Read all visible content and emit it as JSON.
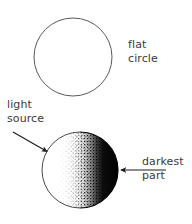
{
  "figure": {
    "background_color": "#ffffff",
    "ink_color": "#1a1a1a",
    "text_color": "#3c3a38",
    "outline_color": "#5a5a5a",
    "width": 192,
    "height": 224
  },
  "shapes": {
    "flat_circle": {
      "name": "flat circle",
      "cx": 73,
      "cy": 57,
      "r": 39,
      "fill": "none",
      "stroke": "#5a5a5a",
      "stroke_width": 1
    },
    "shaded_sphere": {
      "name": "shaded sphere",
      "cx": 80,
      "cy": 170,
      "r": 38,
      "lit_side": "left",
      "dark_side": "right",
      "shading_style": "stipple",
      "highlight_color": "#ffffff",
      "shadow_color": "#000000"
    }
  },
  "labels": {
    "flat_circle": {
      "line1": "flat",
      "line2": "circle"
    },
    "light_source": {
      "line1": "light",
      "line2": "source"
    },
    "darkest_part": {
      "line1": "darkest",
      "line2": "part"
    }
  },
  "arrows": {
    "light_source_arrow": {
      "from_x": 13,
      "from_y": 132,
      "to_x": 49,
      "to_y": 153,
      "direction": "down-right",
      "color": "#1a1a1a"
    },
    "darkest_part_arrow": {
      "from_x": 166,
      "from_y": 170,
      "to_x": 119,
      "to_y": 170,
      "direction": "left",
      "color": "#1a1a1a"
    }
  }
}
